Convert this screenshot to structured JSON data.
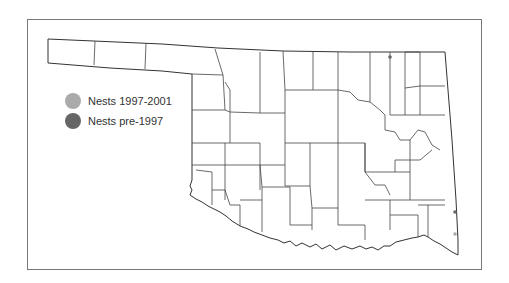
{
  "map": {
    "region": "Oklahoma counties",
    "legend": [
      {
        "label": "Nests 1997-2001",
        "color": "#aaaaaa"
      },
      {
        "label": "Nests pre-1997",
        "color": "#666666"
      }
    ],
    "points": [
      {
        "category": "Nests pre-1997",
        "x": 390,
        "y": 57,
        "color": "#666666"
      },
      {
        "category": "Nests pre-1997",
        "x": 455,
        "y": 212,
        "color": "#666666"
      },
      {
        "category": "Nests 1997-2001",
        "x": 455,
        "y": 234,
        "color": "#aaaaaa"
      }
    ],
    "colors": {
      "outline": "#333333",
      "county_lines": "#444444",
      "frame": "#777777",
      "background": "#ffffff"
    }
  }
}
